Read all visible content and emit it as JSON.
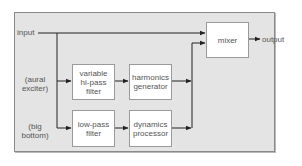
{
  "diagram": {
    "colors": {
      "panel_fill": "#e4e4e4",
      "panel_border": "#8a8a8a",
      "box_fill": "#ffffff",
      "line": "#222222",
      "text": "#555555"
    },
    "labels": {
      "input": "input",
      "output": "output",
      "aural_exciter": "(aural exciter)",
      "big_bottom": "(big bottom)"
    },
    "blocks": {
      "variable_hipass_filter": "variable hi-pass filter",
      "harmonics_generator": "harmonics generator",
      "lowpass_filter": "low-pass filter",
      "dynamics_processor": "dynamics processor",
      "mixer": "mixer"
    },
    "edges": [
      {
        "from": "input",
        "to": "mixer"
      },
      {
        "from": "input",
        "to": "variable hi-pass filter"
      },
      {
        "from": "input",
        "to": "low-pass filter"
      },
      {
        "from": "variable hi-pass filter",
        "to": "harmonics generator"
      },
      {
        "from": "low-pass filter",
        "to": "dynamics processor"
      },
      {
        "from": "harmonics generator",
        "to": "mixer"
      },
      {
        "from": "dynamics processor",
        "to": "mixer"
      },
      {
        "from": "mixer",
        "to": "output"
      }
    ]
  }
}
